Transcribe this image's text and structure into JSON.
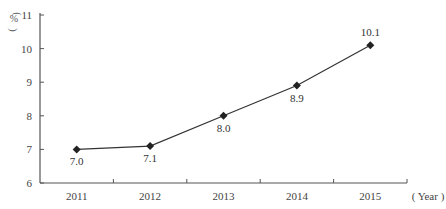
{
  "chart_data": {
    "type": "line",
    "title": "",
    "xlabel": "( Year )",
    "ylabel": "( % )",
    "categories": [
      "2011",
      "2012",
      "2013",
      "2014",
      "2015"
    ],
    "series": [
      {
        "name": "value",
        "values": [
          7.0,
          7.1,
          8.0,
          8.9,
          10.1
        ],
        "labels": [
          "7.0",
          "7.1",
          "8.0",
          "8.9",
          "10.1"
        ],
        "marker": "diamond"
      }
    ],
    "ylim": [
      6,
      11
    ],
    "yticks": [
      "6",
      "7",
      "8",
      "9",
      "10",
      "11"
    ],
    "grid": false,
    "legend": "none",
    "line_color": "#333333"
  }
}
